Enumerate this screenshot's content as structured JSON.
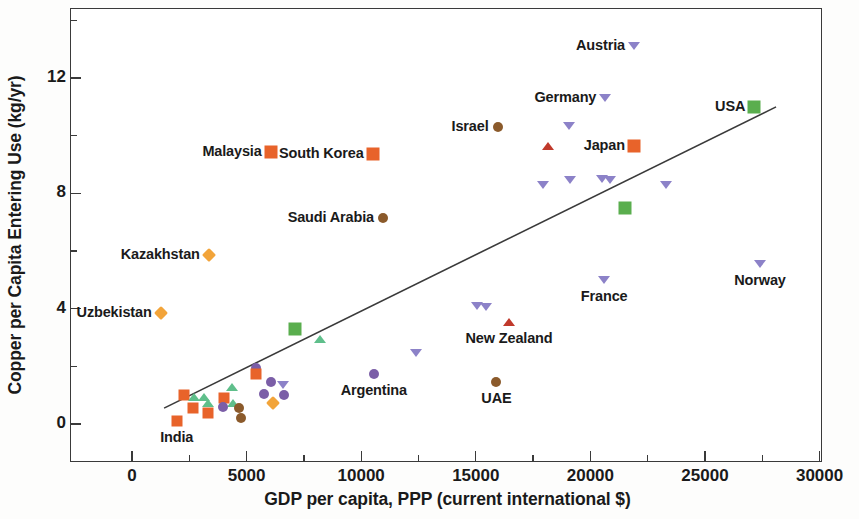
{
  "chart_data": {
    "type": "scatter",
    "title": "",
    "xlabel": "GDP per capita, PPP (current international $)",
    "ylabel": "Copper per Capita Entering Use (kg/yr)",
    "xlim": [
      -1500,
      30000
    ],
    "ylim": [
      -1.6,
      14.0
    ],
    "grid": false,
    "legend": "none",
    "x_ticks_major": [
      0,
      5000,
      10000,
      15000,
      20000,
      25000,
      30000
    ],
    "x_tick_labels": [
      "0",
      "5000",
      "10000",
      "15000",
      "20000",
      "25000",
      "30000"
    ],
    "x_ticks_minor": [
      2500,
      7500,
      12500,
      17500,
      22500,
      27500
    ],
    "y_ticks_major": [
      0,
      4,
      8,
      12
    ],
    "y_tick_labels": [
      "0",
      "4",
      "8",
      "12"
    ],
    "y_ticks_minor": [
      2,
      6,
      10,
      14
    ],
    "marker_colors": {
      "orange_square": "#E8632A",
      "green_square": "#5AAE4E",
      "orange_diamond": "#F2A43A",
      "brown_circle": "#8B5A2B",
      "purple_circle": "#7B5EA7",
      "purple_triangle_down": "#8C82C8",
      "red_triangle_up": "#C0392B",
      "green_triangle_up": "#5FBF8B",
      "line": "#3a3a3a"
    },
    "trend_line": {
      "x0": 1400,
      "y0": 0.55,
      "x1": 28100,
      "y1": 11.0
    },
    "points": [
      {
        "label": "India",
        "label_pos": "below",
        "x": 1950,
        "y": 0.12,
        "marker": "square",
        "color": "#E8632A"
      },
      {
        "label": "Uzbekistan",
        "label_pos": "left",
        "x": 1250,
        "y": 3.85,
        "marker": "diamond",
        "color": "#F2A43A"
      },
      {
        "label": "Kazakhstan",
        "label_pos": "left",
        "x": 3350,
        "y": 5.85,
        "marker": "diamond",
        "color": "#F2A43A"
      },
      {
        "label": "Malaysia",
        "label_pos": "left",
        "x": 6050,
        "y": 9.45,
        "marker": "square-lg",
        "color": "#E8632A"
      },
      {
        "label": "South Korea",
        "label_pos": "left",
        "x": 10500,
        "y": 9.35,
        "marker": "square-lg",
        "color": "#E8632A"
      },
      {
        "label": "Saudi Arabia",
        "label_pos": "left",
        "x": 10950,
        "y": 7.15,
        "marker": "circle",
        "color": "#8B5A2B"
      },
      {
        "label": "Israel",
        "label_pos": "left",
        "x": 15950,
        "y": 10.3,
        "marker": "circle",
        "color": "#8B5A2B"
      },
      {
        "label": "Austria",
        "label_pos": "left",
        "x": 21900,
        "y": 13.1,
        "marker": "tri-down",
        "color": "#8C82C8"
      },
      {
        "label": "Germany",
        "label_pos": "left",
        "x": 20650,
        "y": 11.3,
        "marker": "tri-down",
        "color": "#8C82C8"
      },
      {
        "label": "Japan",
        "label_pos": "left",
        "x": 21900,
        "y": 9.65,
        "marker": "square-lg",
        "color": "#E8632A"
      },
      {
        "label": "USA",
        "label_pos": "left",
        "x": 27150,
        "y": 11.0,
        "marker": "square-lg",
        "color": "#5AAE4E"
      },
      {
        "label": "France",
        "label_pos": "below",
        "x": 20600,
        "y": 5.0,
        "marker": "tri-down",
        "color": "#8C82C8"
      },
      {
        "label": "Norway",
        "label_pos": "below",
        "x": 27400,
        "y": 5.55,
        "marker": "tri-down",
        "color": "#8C82C8"
      },
      {
        "label": "New Zealand",
        "label_pos": "below",
        "x": 16450,
        "y": 3.55,
        "marker": "tri-up",
        "color": "#C0392B"
      },
      {
        "label": "UAE",
        "label_pos": "below",
        "x": 15900,
        "y": 1.45,
        "marker": "circle",
        "color": "#8B5A2B"
      },
      {
        "label": "Argentina",
        "label_pos": "below",
        "x": 10550,
        "y": 1.75,
        "marker": "circle",
        "color": "#7B5EA7"
      },
      {
        "label": "",
        "x": 18150,
        "y": 9.65,
        "marker": "tri-up",
        "color": "#C0392B"
      },
      {
        "label": "",
        "x": 19050,
        "y": 10.35,
        "marker": "tri-down",
        "color": "#8C82C8"
      },
      {
        "label": "",
        "x": 19100,
        "y": 8.45,
        "marker": "tri-down",
        "color": "#8C82C8"
      },
      {
        "label": "",
        "x": 17950,
        "y": 8.3,
        "marker": "tri-down",
        "color": "#8C82C8"
      },
      {
        "label": "",
        "x": 20500,
        "y": 8.5,
        "marker": "tri-down",
        "color": "#8C82C8"
      },
      {
        "label": "",
        "x": 20850,
        "y": 8.45,
        "marker": "tri-down",
        "color": "#8C82C8"
      },
      {
        "label": "",
        "x": 23300,
        "y": 8.3,
        "marker": "tri-down",
        "color": "#8C82C8"
      },
      {
        "label": "",
        "x": 21500,
        "y": 7.5,
        "marker": "square-lg",
        "color": "#5AAE4E"
      },
      {
        "label": "",
        "x": 15050,
        "y": 4.1,
        "marker": "tri-down",
        "color": "#8C82C8"
      },
      {
        "label": "",
        "x": 15450,
        "y": 4.05,
        "marker": "tri-down",
        "color": "#8C82C8"
      },
      {
        "label": "",
        "x": 12400,
        "y": 2.45,
        "marker": "tri-down",
        "color": "#8C82C8"
      },
      {
        "label": "",
        "x": 7100,
        "y": 3.3,
        "marker": "square-lg",
        "color": "#5AAE4E"
      },
      {
        "label": "",
        "x": 8200,
        "y": 2.95,
        "marker": "tri-up",
        "color": "#5FBF8B"
      },
      {
        "label": "",
        "x": 5400,
        "y": 1.95,
        "marker": "circle",
        "color": "#7B5EA7"
      },
      {
        "label": "",
        "x": 5400,
        "y": 1.72,
        "marker": "square",
        "color": "#E8632A"
      },
      {
        "label": "",
        "x": 6050,
        "y": 1.45,
        "marker": "circle",
        "color": "#7B5EA7"
      },
      {
        "label": "",
        "x": 6600,
        "y": 1.35,
        "marker": "tri-down",
        "color": "#8C82C8"
      },
      {
        "label": "",
        "x": 5750,
        "y": 1.05,
        "marker": "circle",
        "color": "#7B5EA7"
      },
      {
        "label": "",
        "x": 6650,
        "y": 1.02,
        "marker": "circle",
        "color": "#7B5EA7"
      },
      {
        "label": "",
        "x": 6150,
        "y": 0.72,
        "marker": "diamond",
        "color": "#F2A43A"
      },
      {
        "label": "",
        "x": 4350,
        "y": 1.3,
        "marker": "tri-up",
        "color": "#5FBF8B"
      },
      {
        "label": "",
        "x": 2250,
        "y": 1.0,
        "marker": "square",
        "color": "#E8632A"
      },
      {
        "label": "",
        "x": 2700,
        "y": 0.95,
        "marker": "tri-up",
        "color": "#5FBF8B"
      },
      {
        "label": "",
        "x": 3150,
        "y": 0.92,
        "marker": "tri-up",
        "color": "#5FBF8B"
      },
      {
        "label": "",
        "x": 3300,
        "y": 0.72,
        "marker": "tri-up",
        "color": "#5FBF8B"
      },
      {
        "label": "",
        "x": 4000,
        "y": 0.9,
        "marker": "square",
        "color": "#E8632A"
      },
      {
        "label": "",
        "x": 4400,
        "y": 0.72,
        "marker": "tri-up",
        "color": "#5FBF8B"
      },
      {
        "label": "",
        "x": 2650,
        "y": 0.55,
        "marker": "square",
        "color": "#E8632A"
      },
      {
        "label": "",
        "x": 3950,
        "y": 0.6,
        "marker": "circle",
        "color": "#7B5EA7"
      },
      {
        "label": "",
        "x": 4650,
        "y": 0.55,
        "marker": "circle",
        "color": "#8B5A2B"
      },
      {
        "label": "",
        "x": 3300,
        "y": 0.38,
        "marker": "square",
        "color": "#E8632A"
      },
      {
        "label": "",
        "x": 4750,
        "y": 0.2,
        "marker": "circle",
        "color": "#8B5A2B"
      }
    ]
  }
}
